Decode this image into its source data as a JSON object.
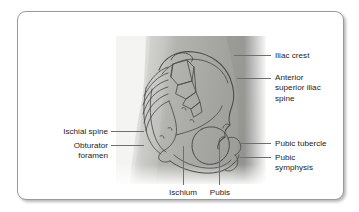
{
  "figure": {
    "kind": "anatomical-illustration",
    "panel": {
      "style": "greyscale photograph with line-art overlay",
      "body_tone": "#a9a9a7",
      "body_tone_dark": "#8e8e8c",
      "body_tone_light": "#d8d8d5",
      "background": "#f4f4f2",
      "ink": "#4a4a4a"
    },
    "leader_color": "#6f6f6f",
    "text_color": "#1c1c1c",
    "card": {
      "background": "#ffffff",
      "border": "#9a9a9a"
    }
  },
  "labels": {
    "iliac_crest": "Iliac crest",
    "anterior_superior_iliac_spine": "Anterior\nsuperior iliac\nspine",
    "pubic_tubercle": "Pubic tubercle",
    "pubic_symphysis": "Pubic\nsymphysis",
    "ischial_spine": "Ischial spine",
    "obturator_foramen": "Obturator\nforamen",
    "ischium": "Ischium",
    "pubis": "Pubis"
  }
}
